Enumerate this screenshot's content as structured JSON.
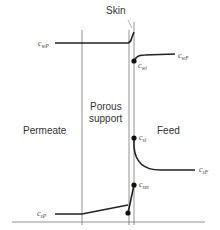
{
  "diagram": {
    "regions": {
      "permeate": "Permeate",
      "support_line1": "Porous",
      "support_line2": "support",
      "feed": "Feed",
      "skin": "Skin"
    },
    "labels": {
      "c_wP": {
        "base": "c",
        "sub": "wP"
      },
      "c_wi": {
        "base": "c",
        "sub": "wi"
      },
      "c_wF": {
        "base": "c",
        "sub": "wF"
      },
      "c_si": {
        "base": "c",
        "sub": "si"
      },
      "c_sF": {
        "base": "c",
        "sub": "sF"
      },
      "c_sm": {
        "base": "c",
        "sub": "sm"
      },
      "c_sP": {
        "base": "c",
        "sub": "sP"
      }
    },
    "colors": {
      "line": "#222222",
      "thin_line": "#777777",
      "text": "#333333"
    }
  }
}
